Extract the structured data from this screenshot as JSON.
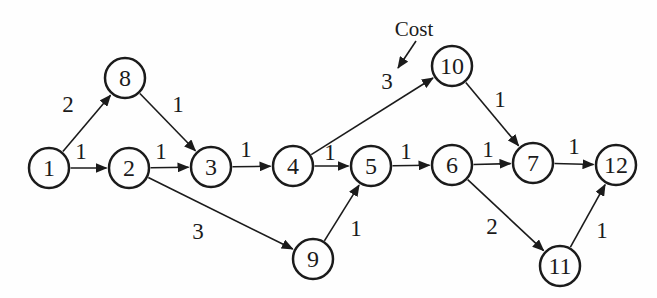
{
  "figure": {
    "background": "#fefefe",
    "ink": "#1b1b1b",
    "node_radius": 20,
    "annotation": {
      "label": "Cost",
      "x": 414,
      "y": 29,
      "arrow": {
        "x1": 416,
        "y1": 41,
        "x2": 398,
        "y2": 68
      }
    },
    "nodes": [
      {
        "id": "1",
        "x": 49,
        "y": 168
      },
      {
        "id": "2",
        "x": 129,
        "y": 168
      },
      {
        "id": "3",
        "x": 211,
        "y": 167
      },
      {
        "id": "4",
        "x": 293,
        "y": 166
      },
      {
        "id": "5",
        "x": 371,
        "y": 166
      },
      {
        "id": "6",
        "x": 452,
        "y": 165
      },
      {
        "id": "7",
        "x": 533,
        "y": 163
      },
      {
        "id": "8",
        "x": 125,
        "y": 78
      },
      {
        "id": "9",
        "x": 313,
        "y": 259
      },
      {
        "id": "10",
        "x": 452,
        "y": 66
      },
      {
        "id": "11",
        "x": 560,
        "y": 266
      },
      {
        "id": "12",
        "x": 616,
        "y": 165
      }
    ],
    "edges": [
      {
        "from": "1",
        "to": "2",
        "cost": "1",
        "label_x": 81,
        "label_y": 151
      },
      {
        "from": "1",
        "to": "8",
        "cost": "2",
        "label_x": 68,
        "label_y": 104
      },
      {
        "from": "8",
        "to": "3",
        "cost": "1",
        "label_x": 178,
        "label_y": 104
      },
      {
        "from": "2",
        "to": "3",
        "cost": "1",
        "label_x": 161,
        "label_y": 151
      },
      {
        "from": "2",
        "to": "9",
        "cost": "3",
        "label_x": 198,
        "label_y": 231
      },
      {
        "from": "3",
        "to": "4",
        "cost": "1",
        "label_x": 246,
        "label_y": 149
      },
      {
        "from": "4",
        "to": "5",
        "cost": "1",
        "label_x": 330,
        "label_y": 152
      },
      {
        "from": "4",
        "to": "10",
        "cost": "3",
        "label_x": 387,
        "label_y": 81
      },
      {
        "from": "9",
        "to": "5",
        "cost": "1",
        "label_x": 356,
        "label_y": 228
      },
      {
        "from": "5",
        "to": "6",
        "cost": "1",
        "label_x": 406,
        "label_y": 151
      },
      {
        "from": "6",
        "to": "7",
        "cost": "1",
        "label_x": 488,
        "label_y": 149
      },
      {
        "from": "10",
        "to": "7",
        "cost": "1",
        "label_x": 500,
        "label_y": 99
      },
      {
        "from": "6",
        "to": "11",
        "cost": "2",
        "label_x": 492,
        "label_y": 226
      },
      {
        "from": "7",
        "to": "12",
        "cost": "1",
        "label_x": 574,
        "label_y": 146
      },
      {
        "from": "11",
        "to": "12",
        "cost": "1",
        "label_x": 602,
        "label_y": 230
      }
    ]
  }
}
